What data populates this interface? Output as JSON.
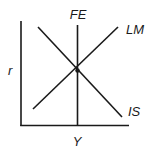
{
  "diagram": {
    "type": "IS-LM-FE model",
    "y_axis_label": "r",
    "x_axis_label": "Y",
    "curves": [
      {
        "name": "FE",
        "label": "FE",
        "shape": "vertical line"
      },
      {
        "name": "LM",
        "label": "LM",
        "shape": "upward-sloping line"
      },
      {
        "name": "IS",
        "label": "IS",
        "shape": "downward-sloping line"
      }
    ],
    "equilibrium_point": "intersection of IS, LM and FE",
    "colors": {
      "line": "#1a1a1a",
      "background": "#ffffff"
    }
  }
}
